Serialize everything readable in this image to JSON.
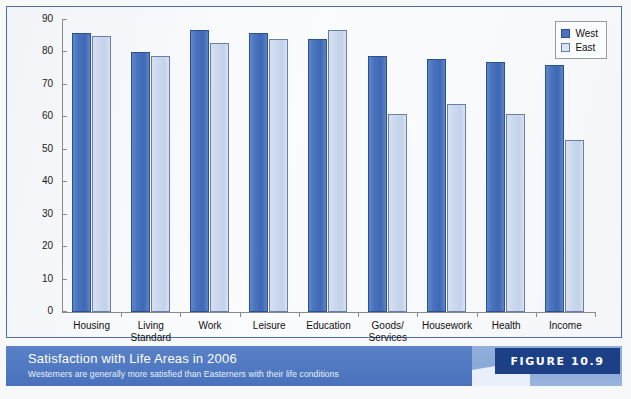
{
  "chart_data": {
    "type": "bar",
    "title": "Satisfaction with Life Areas in 2006",
    "subtitle": "Westerners are generally more satisfied than Easterners with their life conditions",
    "xlabel": "",
    "ylabel": "Percent Satisfied",
    "ylim": [
      0,
      90
    ],
    "yticks": [
      0,
      10,
      20,
      30,
      40,
      50,
      60,
      70,
      80,
      90
    ],
    "ytick_labels": [
      "0",
      "10",
      "20",
      "30",
      "40",
      "50",
      "60",
      "70",
      "80",
      "90"
    ],
    "grid": false,
    "legend_position": "top-right",
    "categories": [
      "Housing",
      "Living\nStandard",
      "Work",
      "Leisure",
      "Education",
      "Goods/\nServices",
      "Housework",
      "Health",
      "Income"
    ],
    "series": [
      {
        "name": "West",
        "color": "#4a74be",
        "values": [
          86,
          80,
          87,
          86,
          84,
          79,
          78,
          77,
          76
        ]
      },
      {
        "name": "East",
        "color": "#dbe3f3",
        "values": [
          85,
          79,
          83,
          84,
          87,
          61,
          64,
          61,
          53
        ]
      }
    ]
  },
  "legend": {
    "items": [
      {
        "label": "West"
      },
      {
        "label": "East"
      }
    ]
  },
  "caption": {
    "title": "Satisfaction with Life Areas in 2006",
    "subtitle": "Westerners are generally more satisfied than Easterners with their life conditions",
    "figure_label": "FIGURE 10.9"
  },
  "colors": {
    "west_bar": "#4a74be",
    "east_bar": "#dbe3f3",
    "caption_band": "#5079c2",
    "badge": "#1d3f86",
    "panel_border": "#4b6fb5"
  }
}
